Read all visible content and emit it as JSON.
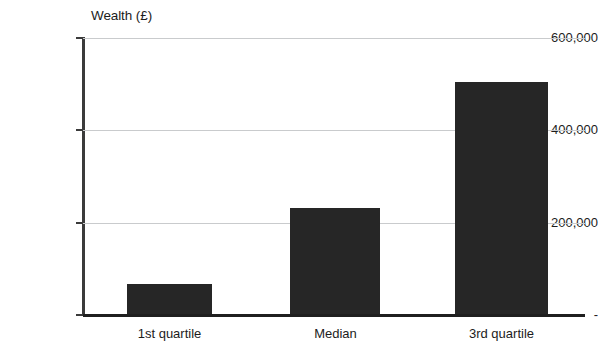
{
  "chart_data": {
    "type": "bar",
    "title": "",
    "ylabel": "Wealth (£)",
    "xlabel": "",
    "categories": [
      "1st quartile",
      "Median",
      "3rd quartile"
    ],
    "values": [
      67000,
      232000,
      505000
    ],
    "ylim": [
      0,
      600000
    ],
    "ytick_labels": [
      "600,000",
      "400,000",
      "200,000",
      "-"
    ],
    "ytick_values": [
      600000,
      400000,
      200000,
      0
    ],
    "grid": true,
    "grid_axis": "y",
    "legend": false,
    "bar_color": "#262626",
    "gridline_color": "#c9cbcd",
    "axis_color": "#3b3b3b",
    "background": "#ffffff"
  }
}
